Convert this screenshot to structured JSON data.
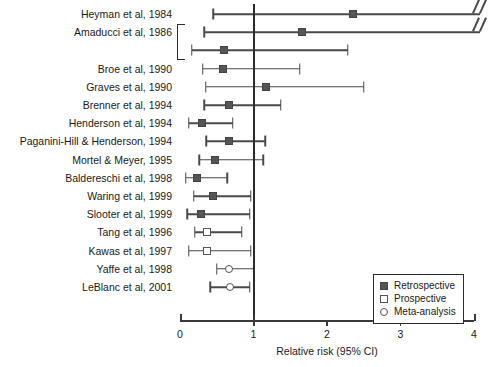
{
  "chart_data": {
    "type": "scatter",
    "plot_kind": "forest-plot",
    "title": "",
    "xlabel": "Relative risk (95% CI)",
    "ylabel": "",
    "xlim": [
      0,
      4
    ],
    "xticks": [
      0,
      1,
      2,
      3,
      4
    ],
    "xticklabels": [
      "0",
      "1",
      "2",
      "3",
      "4"
    ],
    "grid": false,
    "reference_line": 1,
    "legend": {
      "position": "bottom-right",
      "entries": [
        {
          "label": "Retrospective",
          "marker": "filled-square",
          "key": "retrospective"
        },
        {
          "label": "Prospective",
          "marker": "open-square",
          "key": "prospective"
        },
        {
          "label": "Meta-analysis",
          "marker": "open-circle",
          "key": "meta"
        }
      ]
    },
    "bracket_groups": [
      {
        "label": "",
        "rows": [
          1,
          2
        ]
      }
    ],
    "studies": [
      {
        "label": "Heyman et al, 1984",
        "estimate": 2.35,
        "ci_low": 0.45,
        "ci_high": 4.0,
        "type": "retrospective",
        "truncated_right": true,
        "show_label": true
      },
      {
        "label": "Amaducci et al, 1986",
        "estimate": 1.66,
        "ci_low": 0.33,
        "ci_high": 4.0,
        "type": "retrospective",
        "truncated_right": true,
        "show_label": true
      },
      {
        "label": "",
        "estimate": 0.6,
        "ci_low": 0.16,
        "ci_high": 2.28,
        "type": "retrospective",
        "truncated_right": false,
        "show_label": false
      },
      {
        "label": "Broe et al, 1990",
        "estimate": 0.58,
        "ci_low": 0.31,
        "ci_high": 1.63,
        "type": "retrospective",
        "truncated_right": false,
        "show_label": true
      },
      {
        "label": "Graves et al, 1990",
        "estimate": 1.17,
        "ci_low": 0.35,
        "ci_high": 2.5,
        "type": "retrospective",
        "truncated_right": false,
        "show_label": true
      },
      {
        "label": "Brenner et al, 1994",
        "estimate": 0.67,
        "ci_low": 0.33,
        "ci_high": 1.37,
        "type": "retrospective",
        "truncated_right": false,
        "show_label": true
      },
      {
        "label": "Henderson et al, 1994",
        "estimate": 0.3,
        "ci_low": 0.12,
        "ci_high": 0.72,
        "type": "retrospective",
        "truncated_right": false,
        "show_label": true
      },
      {
        "label": "Paganini-Hill & Henderson, 1994",
        "estimate": 0.67,
        "ci_low": 0.36,
        "ci_high": 1.16,
        "type": "retrospective",
        "truncated_right": false,
        "show_label": true
      },
      {
        "label": "Mortel & Meyer, 1995",
        "estimate": 0.48,
        "ci_low": 0.26,
        "ci_high": 1.13,
        "type": "retrospective",
        "truncated_right": false,
        "show_label": true
      },
      {
        "label": "Baldereschi et al, 1998",
        "estimate": 0.23,
        "ci_low": 0.08,
        "ci_high": 0.64,
        "type": "retrospective",
        "truncated_right": false,
        "show_label": true
      },
      {
        "label": "Waring et al, 1999",
        "estimate": 0.45,
        "ci_low": 0.19,
        "ci_high": 0.96,
        "type": "retrospective",
        "truncated_right": false,
        "show_label": true
      },
      {
        "label": "Slooter et al, 1999",
        "estimate": 0.29,
        "ci_low": 0.1,
        "ci_high": 0.95,
        "type": "retrospective",
        "truncated_right": false,
        "show_label": true
      },
      {
        "label": "Tang et al, 1996",
        "estimate": 0.37,
        "ci_low": 0.2,
        "ci_high": 0.84,
        "type": "prospective",
        "truncated_right": false,
        "show_label": true
      },
      {
        "label": "Kawas et al, 1997",
        "estimate": 0.37,
        "ci_low": 0.12,
        "ci_high": 0.96,
        "type": "prospective",
        "truncated_right": false,
        "show_label": true
      },
      {
        "label": "Yaffe et al, 1998",
        "estimate": 0.67,
        "ci_low": 0.5,
        "ci_high": 1.0,
        "type": "meta",
        "truncated_right": false,
        "show_label": true
      },
      {
        "label": "LeBlanc et al, 2001",
        "estimate": 0.68,
        "ci_low": 0.41,
        "ci_high": 0.95,
        "type": "meta",
        "truncated_right": false,
        "show_label": true
      }
    ]
  }
}
